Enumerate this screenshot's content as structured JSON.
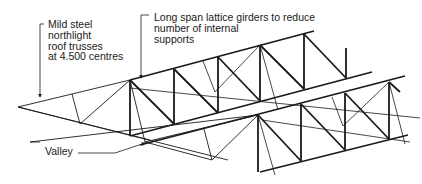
{
  "diagram": {
    "type": "isometric structural sketch",
    "colors": {
      "line": "#1a1a1a",
      "background": "#ffffff",
      "text": "#1a1a1a"
    }
  },
  "labels": {
    "trusses": {
      "lines": [
        "Mild steel",
        "northlight",
        "roof trusses",
        "at 4.500 centres"
      ],
      "text": "Mild steel\nnorthlight\nroof trusses\nat 4.500 centres"
    },
    "girders": {
      "lines": [
        "Long span lattice girders to reduce",
        "number of internal",
        "supports"
      ],
      "text": "Long span lattice girders to reduce\nnumber of internal\nsupports"
    },
    "valley": {
      "text": "Valley"
    }
  }
}
